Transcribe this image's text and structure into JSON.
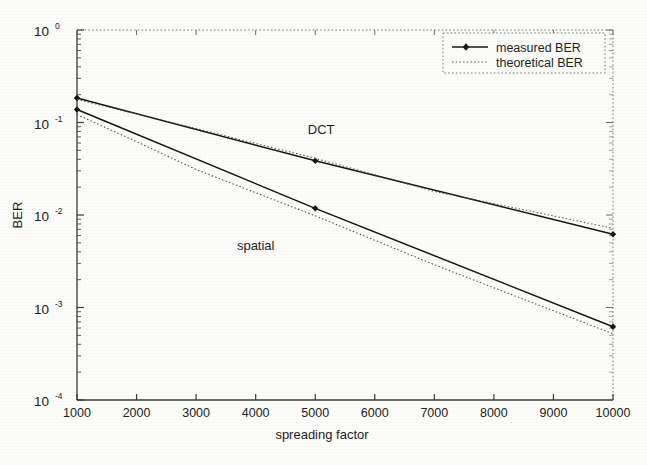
{
  "chart_data": {
    "type": "line",
    "title": "",
    "xlabel": "spreading factor",
    "ylabel": "BER",
    "xlim": [
      1000,
      10000
    ],
    "ylim": [
      0.0001,
      1
    ],
    "yscale": "log",
    "xscale": "linear",
    "grid": false,
    "legend_position": "top-right",
    "x_ticks": [
      1000,
      2000,
      3000,
      4000,
      5000,
      6000,
      7000,
      8000,
      9000,
      10000
    ],
    "x_tick_labels": [
      "1000",
      "2000",
      "3000",
      "4000",
      "5000",
      "6000",
      "7000",
      "8000",
      "9000",
      "10000"
    ],
    "y_ticks": [
      0.0001,
      0.001,
      0.01,
      0.1,
      1
    ],
    "y_tick_labels": [
      "10-4",
      "10-3",
      "10-2",
      "10-1",
      "100"
    ],
    "y_tick_bases": [
      "10",
      "10",
      "10",
      "10",
      "10"
    ],
    "y_tick_exponents": [
      "-4",
      "-3",
      "-2",
      "-1",
      "0"
    ],
    "legend": [
      {
        "label": "measured BER",
        "style": "solid-with-marker"
      },
      {
        "label": "theoretical BER",
        "style": "dotted"
      }
    ],
    "annotations": [
      {
        "text": "DCT",
        "x": 5100,
        "y": 0.075
      },
      {
        "text": "spatial",
        "x": 4000,
        "y": 0.0042
      }
    ],
    "series": [
      {
        "name": "DCT measured BER",
        "style": "solid-with-marker",
        "x": [
          1000,
          5000,
          10000
        ],
        "values": [
          0.184,
          0.0385,
          0.0062
        ]
      },
      {
        "name": "DCT theoretical BER",
        "style": "dotted",
        "x": [
          1000,
          3000,
          5000,
          7000,
          10000
        ],
        "values": [
          0.178,
          0.086,
          0.041,
          0.018,
          0.0072
        ]
      },
      {
        "name": "spatial measured BER",
        "style": "solid-with-marker",
        "x": [
          1000,
          5000,
          10000
        ],
        "values": [
          0.138,
          0.0118,
          0.00062
        ]
      },
      {
        "name": "spatial theoretical BER",
        "style": "dotted",
        "x": [
          1000,
          2000,
          3000,
          5000,
          7000,
          10000
        ],
        "values": [
          0.122,
          0.062,
          0.031,
          0.0098,
          0.0029,
          0.00052
        ]
      }
    ]
  },
  "figure": {
    "axis_color": "#3a3a3a",
    "line_color": "#1a1a1a",
    "background": "#fcfcfa"
  }
}
